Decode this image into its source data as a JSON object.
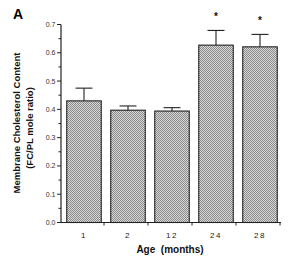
{
  "panel_label": "A",
  "chart_data": {
    "type": "bar",
    "title": "",
    "xlabel": "Age  (months)",
    "ylabel": [
      "Membrane  Cholesterol  Content",
      "(FC/PL mole ratio)"
    ],
    "categories": [
      "1",
      "2",
      "12",
      "24",
      "28"
    ],
    "values": [
      0.43,
      0.397,
      0.394,
      0.627,
      0.621
    ],
    "error_upper": [
      0.475,
      0.412,
      0.406,
      0.679,
      0.665
    ],
    "significance": [
      "",
      "",
      "",
      "*",
      "*"
    ],
    "ylim": [
      0.0,
      0.7
    ],
    "yticks": [
      "0.0",
      "0.1",
      "0.2",
      "0.3",
      "0.4",
      "0.5",
      "0.6",
      "0.7"
    ],
    "grid": false,
    "legend": null,
    "bar_fill": "#9a9a9a",
    "bar_fill_light": "#d8d8d8",
    "bar_edge": "#222222"
  }
}
